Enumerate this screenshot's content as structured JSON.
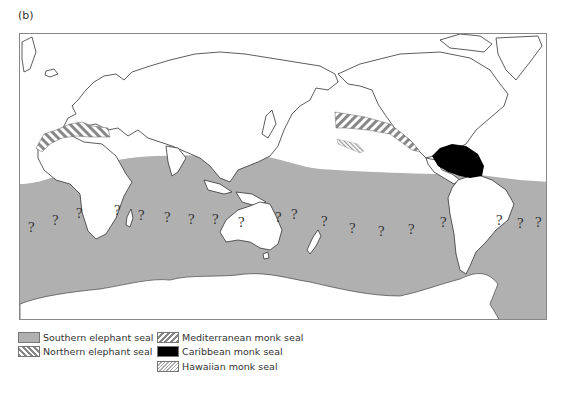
{
  "figure": {
    "panel_label": "(b)",
    "map": {
      "projection": "Pacific-centered world map",
      "colors": {
        "land_outline": "#333333",
        "ocean": "#ffffff",
        "southern_elephant_seal": "#b0b0b0",
        "caribbean_monk_seal": "#000000",
        "hatch": "#888888",
        "frame": "#888888"
      },
      "uncertainty_marker": "?",
      "question_marks": [
        {
          "x": 8,
          "y": 198
        },
        {
          "x": 32,
          "y": 191
        },
        {
          "x": 56,
          "y": 184
        },
        {
          "x": 94,
          "y": 181
        },
        {
          "x": 118,
          "y": 186
        },
        {
          "x": 144,
          "y": 188
        },
        {
          "x": 168,
          "y": 190
        },
        {
          "x": 192,
          "y": 190
        },
        {
          "x": 218,
          "y": 193
        },
        {
          "x": 255,
          "y": 188
        },
        {
          "x": 271,
          "y": 185
        },
        {
          "x": 301,
          "y": 192
        },
        {
          "x": 329,
          "y": 199
        },
        {
          "x": 358,
          "y": 202
        },
        {
          "x": 388,
          "y": 200
        },
        {
          "x": 420,
          "y": 193
        },
        {
          "x": 476,
          "y": 191
        },
        {
          "x": 497,
          "y": 194
        },
        {
          "x": 515,
          "y": 193
        }
      ]
    },
    "legend": {
      "items": [
        {
          "label": "Southern elephant seal",
          "pattern": "solid-grey"
        },
        {
          "label": "Northern elephant seal",
          "pattern": "diagonal-hatch-down"
        },
        {
          "label": "Mediterranean monk seal",
          "pattern": "diagonal-hatch-up"
        },
        {
          "label": "Caribbean monk seal",
          "pattern": "solid-black"
        },
        {
          "label": "Hawaiian monk seal",
          "pattern": "fine-hatch"
        }
      ]
    }
  }
}
